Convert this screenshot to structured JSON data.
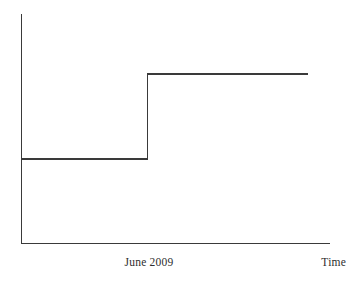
{
  "figure": {
    "background_color": "#ffffff",
    "line_color": "#3a3a3a",
    "text_color": "#2e2e2e"
  },
  "labels": {
    "event_marker": "June 2009",
    "x_axis_title": "Time"
  },
  "chart_data": {
    "type": "line",
    "subtype": "step",
    "title": "",
    "subtitle": "",
    "xlabel": "Time",
    "ylabel": "",
    "grid": false,
    "legend": null,
    "axes": {
      "x_axis": {
        "label": "Time",
        "ticks": [
          "June 2009"
        ],
        "tick_values": [
          0.41
        ],
        "range": [
          0,
          1
        ],
        "numeric_ticks_shown": false,
        "arrowhead": false
      },
      "y_axis": {
        "label": "",
        "ticks": [],
        "range": [
          0,
          1
        ],
        "numeric_ticks_shown": false,
        "arrowhead": false
      }
    },
    "annotations": [
      {
        "text": "June 2009",
        "x": 0.41,
        "y": 0,
        "position": "below-axis",
        "describes": "point in time at which the step increase occurs"
      },
      {
        "text": "Time",
        "x": 1.0,
        "y": 0,
        "position": "below-axis-right",
        "describes": "x axis title"
      }
    ],
    "series": [
      {
        "name": "level",
        "style": "step-post",
        "color": "#3a3a3a",
        "x": [
          0.0,
          0.41,
          0.41,
          0.93
        ],
        "y": [
          0.366,
          0.366,
          0.738,
          0.738
        ],
        "points": [
          {
            "x": 0.0,
            "y": 0.366,
            "note": "start of lower plateau"
          },
          {
            "x": 0.41,
            "y": 0.366,
            "note": "end of lower plateau at June 2009"
          },
          {
            "x": 0.41,
            "y": 0.738,
            "note": "instantaneous jump up at June 2009"
          },
          {
            "x": 0.93,
            "y": 0.738,
            "note": "end of upper plateau"
          }
        ],
        "step_size": 0.372
      }
    ]
  },
  "geometry": {
    "width": 359,
    "height": 285,
    "plot": {
      "left": 21,
      "right": 330,
      "top": 14,
      "bottom": 243
    },
    "series_pixels": {
      "lower_level_y": 159,
      "upper_level_y": 74,
      "step_x": 149,
      "line_start_x": 21,
      "line_end_x": 308
    }
  }
}
